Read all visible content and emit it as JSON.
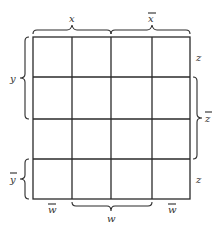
{
  "diagram": {
    "type": "karnaugh-map",
    "rows": 4,
    "cols": 4,
    "top_labels": [
      {
        "text": "x",
        "overbar": false,
        "span": "cols 1-2"
      },
      {
        "text": "x",
        "overbar": true,
        "span": "cols 3-4"
      }
    ],
    "left_labels": [
      {
        "text": "y",
        "overbar": false,
        "span": "rows 1-2"
      },
      {
        "text": "y",
        "overbar": true,
        "span": "row 4"
      }
    ],
    "right_labels": [
      {
        "text": "z",
        "overbar": false,
        "span": "row 1"
      },
      {
        "text": "z",
        "overbar": true,
        "span": "rows 2-3"
      },
      {
        "text": "z",
        "overbar": false,
        "span": "row 4"
      }
    ],
    "bottom_labels": [
      {
        "text": "w",
        "overbar": true,
        "span": "col 1"
      },
      {
        "text": "w",
        "overbar": false,
        "span": "cols 2-3"
      },
      {
        "text": "w",
        "overbar": true,
        "span": "col 4"
      }
    ],
    "colors": {
      "line": "#2a2a2a",
      "background": "#ffffff"
    }
  }
}
